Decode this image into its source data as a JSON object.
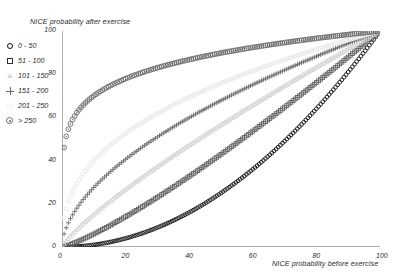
{
  "axes": {
    "ylabel": "NICE probability after exercise",
    "xlabel": "NICE probability before exercise",
    "xticks": [
      "0",
      "20",
      "40",
      "60",
      "80",
      "100"
    ],
    "yticks": [
      "0",
      "20",
      "40",
      "60",
      "80",
      "100"
    ]
  },
  "legend": {
    "items": [
      {
        "label": "0 - 50",
        "marker": "open-circle-marker",
        "color": "#111111"
      },
      {
        "label": "51 - 100",
        "marker": "open-square-marker",
        "color": "#2f2f2f"
      },
      {
        "label": "101 - 150",
        "marker": "open-triangle-marker",
        "color": "#d8d8d8"
      },
      {
        "label": "151 - 200",
        "marker": "plus-marker",
        "color": "#6a6a6a"
      },
      {
        "label": "201 - 250",
        "marker": "faint-circle-marker",
        "color": "#f0f0f0"
      },
      {
        "label": "> 250",
        "marker": "circled-dot-marker",
        "color": "#6b6b6b"
      }
    ]
  },
  "chart_data": {
    "type": "scatter",
    "title": "",
    "xlabel": "NICE probability before exercise",
    "ylabel": "NICE probability after exercise",
    "xlim": [
      0,
      100
    ],
    "ylim": [
      0,
      100
    ],
    "grid": false,
    "legend_position": "left-outside",
    "note": "Six monotonic series, all running from (0,0) to (100,100); y = 100*(x/100)^k",
    "series": [
      {
        "name": "0 - 50",
        "marker": "open-circle-marker",
        "color": "#111111",
        "exponent": 2.0,
        "x": [
          0,
          2,
          4,
          6,
          8,
          10,
          12,
          14,
          16,
          18,
          20,
          22,
          24,
          26,
          28,
          30,
          32,
          34,
          36,
          38,
          40,
          42,
          44,
          46,
          48,
          50,
          52,
          54,
          56,
          58,
          60,
          62,
          64,
          66,
          68,
          70,
          72,
          74,
          76,
          78,
          80,
          82,
          84,
          86,
          88,
          90,
          92,
          94,
          96,
          98,
          100
        ],
        "y": [
          0,
          0.0,
          0.2,
          0.4,
          0.6,
          1.0,
          1.4,
          2.0,
          2.6,
          3.2,
          4.0,
          4.8,
          5.8,
          6.8,
          7.8,
          9.0,
          10.2,
          11.6,
          13.0,
          14.4,
          16.0,
          17.6,
          19.4,
          21.2,
          23.0,
          25.0,
          27.0,
          29.2,
          31.4,
          33.6,
          36.0,
          38.4,
          41.0,
          43.6,
          46.2,
          49.0,
          51.8,
          54.8,
          57.8,
          60.8,
          64.0,
          67.2,
          70.6,
          74.0,
          77.4,
          81.0,
          84.6,
          88.4,
          92.2,
          96.0,
          100.0
        ]
      },
      {
        "name": "51 - 100",
        "marker": "open-square-marker",
        "color": "#5e5e5e",
        "exponent": 1.22,
        "x": [
          0,
          5,
          10,
          15,
          20,
          25,
          30,
          35,
          40,
          45,
          50,
          55,
          60,
          65,
          70,
          75,
          80,
          85,
          90,
          95,
          100
        ],
        "y": [
          0,
          3.4,
          7.9,
          12.9,
          18.3,
          23.9,
          29.8,
          35.9,
          42.2,
          48.6,
          55.2,
          61.9,
          68.7,
          75.6,
          82.6,
          89.7,
          96.9,
          104.2,
          111.5,
          118.9,
          100.0
        ]
      },
      {
        "name": "101 - 150",
        "marker": "open-triangle-marker",
        "color": "#d0d0d0",
        "exponent": 0.82,
        "x": [
          0,
          5,
          10,
          15,
          20,
          25,
          30,
          35,
          40,
          45,
          50,
          55,
          60,
          65,
          70,
          75,
          80,
          85,
          90,
          95,
          100
        ],
        "y": [
          0,
          8.0,
          14.1,
          19.6,
          24.8,
          29.7,
          34.5,
          39.1,
          43.6,
          48.0,
          52.3,
          56.5,
          60.7,
          64.8,
          68.8,
          72.8,
          76.7,
          80.6,
          84.5,
          88.3,
          100.0
        ]
      },
      {
        "name": "151 - 200",
        "marker": "plus-marker",
        "color": "#6a6a6a",
        "exponent": 0.56,
        "x": [
          0,
          5,
          10,
          15,
          20,
          25,
          30,
          35,
          40,
          45,
          50,
          55,
          60,
          65,
          70,
          75,
          80,
          85,
          90,
          95,
          100
        ],
        "y": [
          0,
          19.3,
          28.5,
          35.6,
          41.6,
          47.0,
          51.9,
          56.4,
          60.6,
          64.6,
          68.4,
          72.1,
          75.6,
          79.0,
          82.3,
          85.5,
          88.6,
          91.6,
          94.6,
          97.5,
          100.0
        ]
      },
      {
        "name": "201 - 250",
        "marker": "faint-circle-marker",
        "color": "#ececec",
        "exponent": 0.4,
        "x": [
          0,
          5,
          10,
          15,
          20,
          25,
          30,
          35,
          40,
          45,
          50,
          55,
          60,
          65,
          70,
          75,
          80,
          85,
          90,
          95,
          100
        ],
        "y": [
          0,
          30.0,
          39.8,
          46.4,
          51.6,
          55.9,
          59.7,
          63.1,
          66.2,
          69.1,
          71.8,
          74.3,
          76.7,
          79.0,
          81.2,
          83.3,
          85.4,
          87.3,
          89.2,
          91.1,
          100.0
        ]
      },
      {
        "name": "> 250",
        "marker": "circled-dot-marker",
        "color": "#6b6b6b",
        "exponent": 0.155,
        "x": [
          0,
          2,
          4,
          6,
          8,
          10,
          14,
          18,
          22,
          26,
          30,
          34,
          38,
          42,
          46,
          50,
          55,
          60,
          65,
          70,
          75,
          80,
          85,
          90,
          95,
          100
        ],
        "y": [
          0,
          56.8,
          62.7,
          66.4,
          69.2,
          71.4,
          74.8,
          77.4,
          79.5,
          81.3,
          82.9,
          84.2,
          85.5,
          86.6,
          87.6,
          88.6,
          89.7,
          90.7,
          91.7,
          92.6,
          93.4,
          94.2,
          95.0,
          95.7,
          96.4,
          100.0
        ]
      }
    ]
  }
}
